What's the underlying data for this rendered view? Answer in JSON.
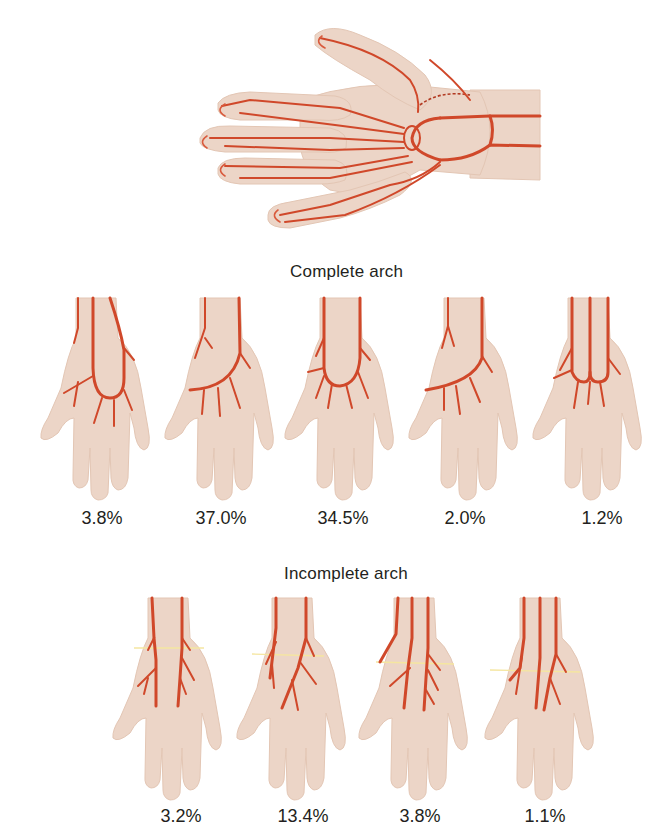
{
  "figure": {
    "top_illustration": {
      "description": "Palmar view of hand showing arterial supply (superficial and deep palmar arches)",
      "colors": {
        "skin": "#ecd5c7",
        "artery": "#d0482a"
      }
    },
    "complete_arch": {
      "title": "Complete arch",
      "variants": [
        {
          "label": "3.8%"
        },
        {
          "label": "37.0%"
        },
        {
          "label": "34.5%"
        },
        {
          "label": "2.0%"
        },
        {
          "label": "1.2%"
        }
      ]
    },
    "incomplete_arch": {
      "title": "Incomplete arch",
      "variants": [
        {
          "label": "3.2%"
        },
        {
          "label": "13.4%"
        },
        {
          "label": "3.8%"
        },
        {
          "label": "1.1%"
        }
      ]
    }
  }
}
